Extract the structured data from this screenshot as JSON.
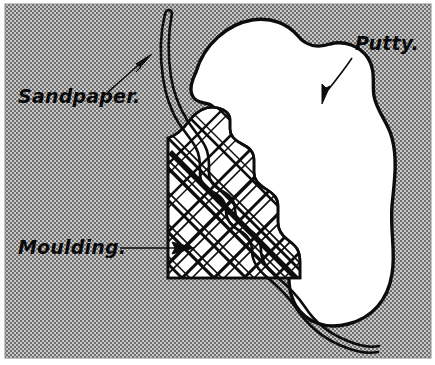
{
  "figure": {
    "width": 435,
    "height": 365,
    "background_color": "#a2a2a2",
    "paper_color": "#ffffff",
    "ink_color": "#0d0d0d",
    "halftone_description": "fine checkerboard halftone screen, mid gray"
  },
  "labels": {
    "sandpaper": {
      "text": "Sandpaper.",
      "x": 18,
      "y": 103,
      "font_size": 19
    },
    "putty": {
      "text": "Putty.",
      "x": 355,
      "y": 50,
      "font_size": 19
    },
    "moulding": {
      "text": "Moulding.",
      "x": 18,
      "y": 254,
      "font_size": 19
    }
  },
  "callouts": [
    {
      "name": "sandpaper-callout",
      "label": "Sandpaper.",
      "leader": "curved line from text up-right to arrowhead",
      "arrow_tip_x": 151,
      "arrow_tip_y": 55,
      "arrow_angle_deg": -40
    },
    {
      "name": "putty-callout",
      "label": "Putty.",
      "leader": "short line from text down-left to arrowhead",
      "arrow_tip_x": 321,
      "arrow_tip_y": 103,
      "arrow_angle_deg": 110
    },
    {
      "name": "moulding-callout",
      "label": "Moulding.",
      "leader": "horizontal line from text right to arrowhead",
      "arrow_tip_x": 190,
      "arrow_tip_y": 248,
      "arrow_angle_deg": 0
    }
  ],
  "parts": {
    "putty_blob": {
      "name": "putty",
      "fill": "#ffffff",
      "stroke": "#0d0d0d",
      "description": "large irregular organic blob of putty sitting on top and right of the moulding"
    },
    "moulding_block": {
      "name": "moulding",
      "fill": "#ffffff",
      "stroke": "#0d0d0d",
      "hatching": "double cross-hatch lattice, diagonals both directions",
      "profile": "stepped ogee moulding profile on top-right; flat left and bottom edges",
      "left_edge_x": 168,
      "bottom_edge_y": 278,
      "right_edge_x": 300
    },
    "sandpaper_strip": {
      "name": "sandpaper",
      "fill": "#ffffff",
      "stroke": "#0d0d0d",
      "description": "narrow double-line strip entering at top, hugging the moulding profile and trailing off at bottom right"
    }
  }
}
